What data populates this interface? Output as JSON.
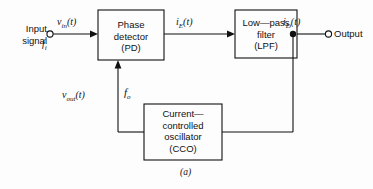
{
  "figure": {
    "caption": "(a)",
    "blocks": [
      {
        "id": "pd",
        "lines": [
          "Phase",
          "detector",
          "(PD)"
        ]
      },
      {
        "id": "lpf",
        "lines": [
          "Low—pass",
          "filter",
          "(LPF)"
        ]
      },
      {
        "id": "cco",
        "lines": [
          "Current—",
          "controlled",
          "oscillator",
          "(CCO)"
        ]
      }
    ],
    "terminals": {
      "input_line1": "Input",
      "input_line2": "signal",
      "output": "Output"
    },
    "signals": {
      "v_in": {
        "base": "v",
        "sub": "in",
        "suffix": "(t)"
      },
      "f_i": {
        "base": "f",
        "sub": "i",
        "suffix": ""
      },
      "i_e": {
        "base": "i",
        "sub": "E",
        "suffix": "(t)"
      },
      "i_d": {
        "base": "i",
        "sub": "D",
        "suffix": "(t)"
      },
      "v_out": {
        "base": "v",
        "sub": "out",
        "suffix": "(t)"
      },
      "f_o": {
        "base": "f",
        "sub": "o",
        "suffix": ""
      }
    },
    "colors": {
      "background": "#fdfdfd",
      "stroke": "#111111",
      "text": "#111111"
    }
  }
}
